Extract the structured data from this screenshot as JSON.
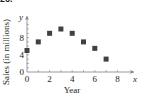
{
  "problem_number": "26.",
  "chart_data": {
    "type": "scatter",
    "title": "",
    "xlabel": "Year",
    "ylabel": "Sales (in millions)",
    "x_axis_var": "x",
    "y_axis_var": "y",
    "x": [
      0,
      1,
      2,
      3,
      4,
      5,
      6,
      7
    ],
    "y": [
      5,
      7,
      9,
      10,
      9,
      7,
      5.5,
      3
    ],
    "xlim": [
      0,
      9
    ],
    "ylim": [
      0,
      12
    ],
    "xticks": [
      "0",
      "2",
      "4",
      "6",
      "8"
    ],
    "yticks": [
      "0",
      "4",
      "8"
    ],
    "grid": false,
    "marker": "square",
    "color": "#414042"
  }
}
